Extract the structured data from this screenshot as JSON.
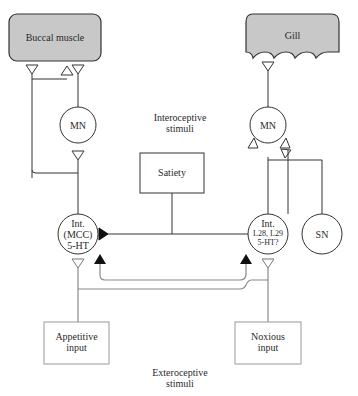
{
  "diagram": {
    "effectors": {
      "buccal_muscle": "Buccal  muscle",
      "gill": "Gill"
    },
    "motor_neurons": {
      "left": "MN",
      "right": "MN"
    },
    "sensory_neuron": "SN",
    "interneurons": {
      "left": {
        "line1": "Int.",
        "line2": "(MCC)",
        "line3": "5-HT"
      },
      "right": {
        "line1": "Int.",
        "line2": "L28, L29",
        "line3": "5-HT?"
      }
    },
    "satiety_box": "Satiety",
    "inputs": {
      "appetitive": {
        "line1": "Appetitive",
        "line2": "input"
      },
      "noxious": {
        "line1": "Noxious",
        "line2": "input"
      }
    },
    "labels": {
      "interoceptive": {
        "line1": "Interoceptive",
        "line2": "stimuli"
      },
      "exteroceptive": {
        "line1": "Exteroceptive",
        "line2": "stimuli"
      }
    },
    "colors": {
      "effector_fill": "#c8c8c8",
      "line": "#333333",
      "gray_line": "#8a8a8a",
      "inhibitory_fill": "#111111"
    }
  }
}
